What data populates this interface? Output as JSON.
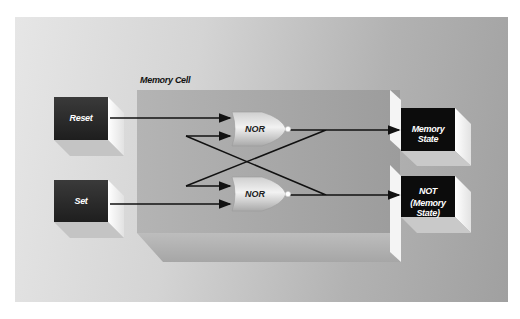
{
  "diagram": {
    "container_title": "Memory Cell",
    "inputs": [
      {
        "id": "reset",
        "label": "Reset"
      },
      {
        "id": "set",
        "label": "Set"
      }
    ],
    "gates": [
      {
        "id": "nor-top",
        "label": "NOR"
      },
      {
        "id": "nor-bottom",
        "label": "NOR"
      }
    ],
    "outputs": [
      {
        "id": "memory-state",
        "label": "Memory State"
      },
      {
        "id": "not-memory-state",
        "label_line1": "NOT",
        "label_line2": "(Memory State)"
      }
    ],
    "connections": [
      {
        "from": "Reset",
        "to": "NOR (top) input 1"
      },
      {
        "from": "NOR (bottom) output",
        "to": "NOR (top) input 2"
      },
      {
        "from": "NOR (top) output",
        "to": "NOR (bottom) input 1"
      },
      {
        "from": "Set",
        "to": "NOR (bottom) input 2"
      },
      {
        "from": "NOR (top) output",
        "to": "Memory State"
      },
      {
        "from": "NOR (bottom) output",
        "to": "NOT (Memory State)"
      }
    ],
    "colors": {
      "input_box": "#2a2a2a",
      "output_box": "#0c0c0c",
      "cell_face": "#a8a8a8",
      "wire": "#111111"
    }
  }
}
